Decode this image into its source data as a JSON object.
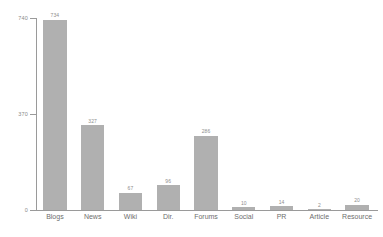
{
  "chart_data": {
    "type": "bar",
    "title": "",
    "subtitle": "",
    "xlabel": "",
    "ylabel": "",
    "categories": [
      "Blogs",
      "News",
      "Wiki",
      "Dir.",
      "Forums",
      "Social",
      "PR",
      "Article",
      "Resource"
    ],
    "values": [
      734,
      327,
      67,
      96,
      286,
      10,
      14,
      2,
      20
    ],
    "value_labels": [
      "734",
      "327",
      "67",
      "96",
      "286",
      "10",
      "14",
      "2",
      "20"
    ],
    "ylim": [
      0,
      740
    ],
    "yticks": [
      0,
      370,
      740
    ],
    "ytick_labels": [
      "0",
      "370",
      "740"
    ],
    "grid": false,
    "legend": null,
    "legend_position": "none",
    "bar_color": "#b0b0b0",
    "axis_color": "#9a9a9a",
    "label_color": "#6e6e6e",
    "value_label_color": "#8e8e8e",
    "background_color": "#ffffff"
  }
}
